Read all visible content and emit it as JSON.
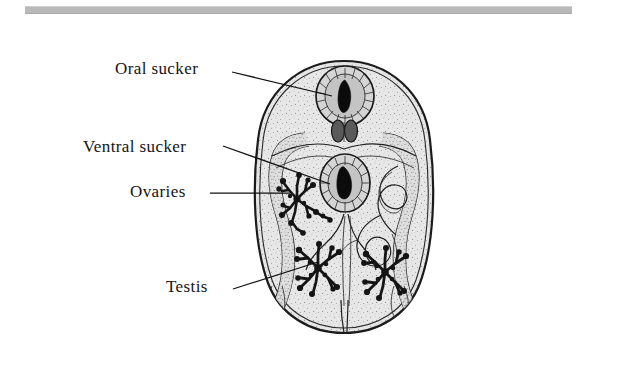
{
  "page": {
    "background_color": "#ffffff",
    "width": 636,
    "height": 371
  },
  "top_rule": {
    "name": "horizontal-rule",
    "color": "#b9b9b9"
  },
  "labels": [
    {
      "id": "oral-sucker",
      "text": "Oral sucker",
      "x": 115,
      "y": 59,
      "leader": {
        "from": [
          232,
          72
        ],
        "to": [
          330,
          95
        ]
      }
    },
    {
      "id": "ventral-sucker",
      "text": "Ventral sucker",
      "x": 83,
      "y": 137,
      "leader": {
        "from": [
          223,
          146
        ],
        "to": [
          327,
          183
        ]
      }
    },
    {
      "id": "ovaries",
      "text": "Ovaries",
      "x": 130,
      "y": 182,
      "leader": {
        "from": [
          210,
          193
        ],
        "to": [
          288,
          193
        ]
      }
    },
    {
      "id": "testis",
      "text": "Testis",
      "x": 166,
      "y": 277,
      "leader": {
        "from": [
          233,
          289
        ],
        "to": [
          316,
          262
        ]
      }
    }
  ],
  "diagram": {
    "organism": "fluke",
    "body": {
      "name": "body-outline",
      "fill_color": "#e6e6e6",
      "stroke_color": "#1b1b1b",
      "center_x": 344,
      "center_y": 197,
      "width": 178,
      "height": 272
    },
    "structures": [
      {
        "id": "oral-sucker",
        "name": "oral-sucker",
        "cx": 345,
        "cy": 96,
        "rx": 28,
        "ry": 29
      },
      {
        "id": "pharynx",
        "name": "pharynx",
        "cx": 345,
        "cy": 131,
        "rx": 11,
        "ry": 11
      },
      {
        "id": "ventral-sucker",
        "name": "ventral-sucker",
        "cx": 345,
        "cy": 183,
        "rx": 24,
        "ry": 28
      },
      {
        "id": "ovaries",
        "name": "ovaries",
        "cx": 297,
        "cy": 200
      },
      {
        "id": "testis-left",
        "name": "testis-left",
        "cx": 318,
        "cy": 268
      },
      {
        "id": "testis-right",
        "name": "testis-right",
        "cx": 385,
        "cy": 272
      },
      {
        "id": "caeca-left",
        "name": "intestinal-caecum-left"
      },
      {
        "id": "caeca-right",
        "name": "intestinal-caecum-right"
      },
      {
        "id": "uterus",
        "name": "uterus-coils"
      }
    ]
  }
}
